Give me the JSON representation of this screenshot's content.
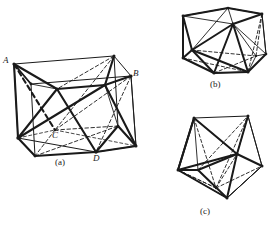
{
  "figure": {
    "background_color": "#ffffff",
    "stroke_color": "#1a1a1a",
    "captions": [
      {
        "id": "a",
        "text": "(a)"
      },
      {
        "id": "b",
        "text": "(b)"
      },
      {
        "id": "c",
        "text": "(c)"
      }
    ],
    "vertex_labels": [
      {
        "id": "A",
        "text": "A"
      },
      {
        "id": "B",
        "text": "B"
      },
      {
        "id": "C",
        "text": "C"
      },
      {
        "id": "D",
        "text": "D"
      }
    ],
    "panels": {
      "a": {
        "name": "cube-with-inscribed-tetrahedron",
        "line_styles": [
          "solid-thin",
          "solid-thick",
          "dashed-thick",
          "dashed-thin"
        ],
        "vertices": {
          "top_back_left": [
            6,
            12
          ],
          "top_back_right": [
            106,
            4
          ],
          "top_front_left": [
            4,
            28
          ],
          "top_front_right": [
            123,
            24
          ],
          "mid_front_left": [
            49,
            36
          ],
          "mid_front_right": [
            97,
            33
          ],
          "bot_front_left": [
            10,
            86
          ],
          "bot_front_right": [
            120,
            82
          ],
          "bot_mid_left": [
            48,
            76
          ],
          "bot_mid_right": [
            88,
            96
          ]
        }
      },
      "b": {
        "name": "rotated-polyhedron-view",
        "line_styles": [
          "solid-thin",
          "solid-thick",
          "dashed-thin"
        ]
      },
      "c": {
        "name": "pentagonal-polyhedron-view",
        "line_styles": [
          "solid-thin",
          "solid-thick",
          "dashed-thin"
        ]
      }
    }
  }
}
